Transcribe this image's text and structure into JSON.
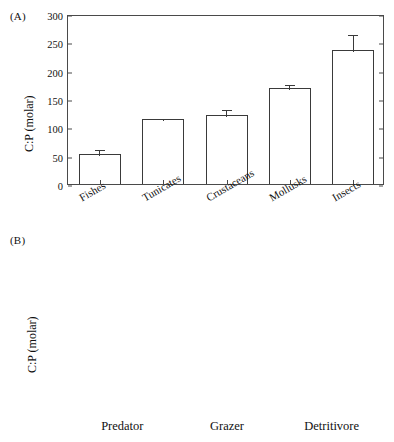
{
  "figure": {
    "ylabel": "C:P (molar)",
    "panel_a_label": "(A)",
    "panel_b_label": "(B)"
  },
  "chart_data": [
    {
      "type": "bar",
      "panel": "(A)",
      "title": "",
      "xlabel": "",
      "ylabel": "C:P (molar)",
      "ylim": [
        0,
        300
      ],
      "yticks": [
        0,
        50,
        100,
        150,
        200,
        250,
        300
      ],
      "grid": false,
      "legend": "none",
      "xtick_rotation_deg": 30,
      "categories": [
        "Fishes",
        "Tunicates",
        "Crustaceans",
        "Mollusks",
        "Insects"
      ],
      "values": [
        53,
        114,
        121,
        170,
        237
      ],
      "errors": [
        10,
        4,
        13,
        9,
        29
      ],
      "error_type": "error bar (upper whisker with cap)",
      "bar_fill": "#ffffff",
      "bar_edge": "#3a3a3a"
    },
    {
      "type": "bar",
      "panel": "(B)",
      "title": "",
      "xlabel": "",
      "ylabel": "C:P (molar)",
      "ylim": [
        0,
        350
      ],
      "yticks": [
        0,
        50,
        100,
        150,
        200,
        250,
        300,
        350
      ],
      "grid": false,
      "legend": "none",
      "xtick_rotation_deg": 0,
      "categories": [
        "Predator",
        "Grazer",
        "Detritivore"
      ],
      "values": [
        87,
        147,
        242
      ],
      "errors": [
        9,
        13,
        45
      ],
      "error_type": "error bar (upper whisker with cap)",
      "bar_fill": "#ffffff",
      "bar_edge": "#3a3a3a"
    }
  ]
}
